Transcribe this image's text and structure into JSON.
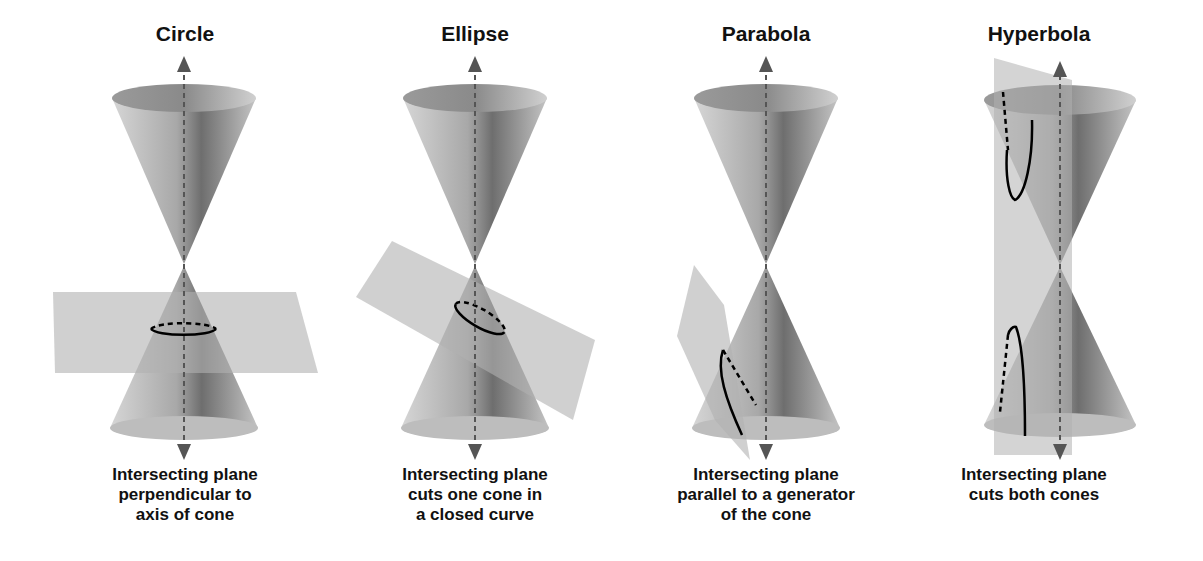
{
  "diagram": {
    "panels": [
      {
        "title": "Circle",
        "caption": [
          "Intersecting plane",
          "perpendicular to",
          "axis of cone"
        ]
      },
      {
        "title": "Ellipse",
        "caption": [
          "Intersecting plane",
          "cuts one cone in",
          "a closed curve"
        ]
      },
      {
        "title": "Parabola",
        "caption": [
          "Intersecting plane",
          "parallel to a generator",
          "of the cone"
        ]
      },
      {
        "title": "Hyperbola",
        "caption": [
          "Intersecting plane",
          "cuts both cones"
        ]
      }
    ],
    "colors": {
      "cone_light": "#d9d9d9",
      "cone_dark": "#7a7a7a",
      "plane": "#b8b8b8",
      "axis": "#555555",
      "curve": "#000000",
      "text": "#111111"
    }
  }
}
